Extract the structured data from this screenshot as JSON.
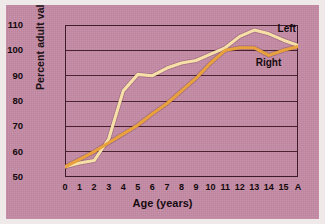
{
  "chart_data": {
    "type": "line",
    "title": "",
    "xlabel": "Age (years)",
    "ylabel": "Percent adult value",
    "xlim": [
      0,
      16
    ],
    "ylim": [
      50,
      110
    ],
    "grid": true,
    "legend_position": "inline-right",
    "x_tick_labels": [
      "0",
      "1",
      "2",
      "3",
      "4",
      "5",
      "6",
      "7",
      "8",
      "9",
      "10",
      "11",
      "12",
      "13",
      "14",
      "15",
      "A"
    ],
    "x": [
      0,
      1,
      2,
      3,
      4,
      5,
      6,
      7,
      8,
      9,
      10,
      11,
      12,
      13,
      14,
      15,
      16
    ],
    "y_tick_labels": [
      "50",
      "60",
      "70",
      "80",
      "90",
      "100",
      "110"
    ],
    "y_ticks": [
      50,
      60,
      70,
      80,
      90,
      100,
      110
    ],
    "series": [
      {
        "name": "Left",
        "color": "#f7e0a8",
        "values": [
          54,
          55.5,
          56.5,
          65,
          84,
          90.5,
          90,
          93,
          95,
          96,
          98.5,
          101,
          105.5,
          108,
          106.5,
          104,
          102
        ]
      },
      {
        "name": "Right",
        "color": "#e8a13c",
        "values": [
          54,
          57,
          60,
          63.5,
          67,
          70.5,
          75,
          79,
          84,
          89,
          95,
          100,
          101,
          101,
          98,
          100,
          101.5
        ]
      }
    ]
  },
  "labels": {
    "left_series": "Left",
    "right_series": "Right"
  }
}
